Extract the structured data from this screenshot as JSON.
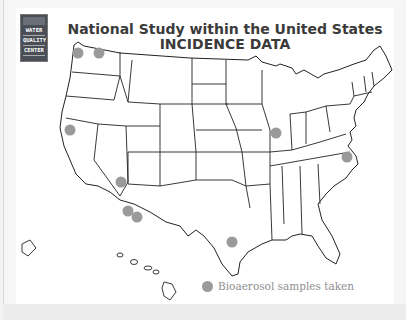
{
  "logo": {
    "lines": [
      "WATER",
      "QUALITY",
      "CENTER"
    ]
  },
  "header": {
    "title_line1": "National Study within the United States",
    "title_line2": "INCIDENCE DATA"
  },
  "legend": {
    "label": "Bioaerosol samples taken",
    "marker_color": "#9a9a9a"
  },
  "map": {
    "region": "United States (contiguous + Alaska + Hawaii)",
    "sample_sites": [
      {
        "state": "Washington (coast)",
        "x": 78,
        "y": 53
      },
      {
        "state": "Washington (inland)",
        "x": 99,
        "y": 53
      },
      {
        "state": "California",
        "x": 70,
        "y": 130
      },
      {
        "state": "Arizona (north)",
        "x": 121,
        "y": 182
      },
      {
        "state": "Arizona (south 1)",
        "x": 128,
        "y": 211
      },
      {
        "state": "Arizona (south 2)",
        "x": 137,
        "y": 217
      },
      {
        "state": "Texas",
        "x": 232,
        "y": 242
      },
      {
        "state": "Illinois",
        "x": 276,
        "y": 133
      },
      {
        "state": "Virginia",
        "x": 347,
        "y": 157
      }
    ]
  }
}
